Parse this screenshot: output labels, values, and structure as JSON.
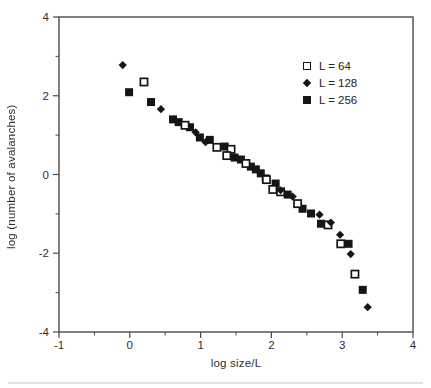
{
  "figure": {
    "background": "#ffffff",
    "frame_color": "#4a4a4a",
    "marker_color": "#151515",
    "text_color": "#2e2e2e"
  },
  "chart_data": {
    "type": "scatter",
    "title": "",
    "xlabel": "log size/L",
    "ylabel": "log (number of avalanches)",
    "xlim": [
      -1,
      4
    ],
    "ylim": [
      -4,
      4
    ],
    "x_major_ticks": [
      -1,
      0,
      1,
      2,
      3,
      4
    ],
    "x_minor_ticks": [
      -0.5,
      0.5,
      1.5,
      2.5,
      3.5
    ],
    "y_major_ticks": [
      -4,
      -2,
      0,
      2,
      4
    ],
    "y_minor_ticks": [
      -3,
      -1,
      1,
      3
    ],
    "grid": false,
    "legend_position": "upper-right-inside",
    "series": [
      {
        "name": "L = 64",
        "marker": "open-square",
        "points": [
          [
            0.2,
            2.35
          ],
          [
            0.78,
            1.25
          ],
          [
            1.23,
            0.69
          ],
          [
            1.43,
            0.64
          ],
          [
            1.37,
            0.48
          ],
          [
            1.64,
            0.28
          ],
          [
            1.93,
            -0.13
          ],
          [
            2.02,
            -0.38
          ],
          [
            2.13,
            -0.44
          ],
          [
            2.37,
            -0.74
          ],
          [
            2.8,
            -1.28
          ],
          [
            2.98,
            -1.76
          ],
          [
            3.18,
            -2.53
          ]
        ]
      },
      {
        "name": "L = 128",
        "marker": "filled-diamond",
        "points": [
          [
            -0.1,
            2.78
          ],
          [
            0.44,
            1.66
          ],
          [
            0.93,
            1.07
          ],
          [
            1.07,
            0.82
          ],
          [
            2.13,
            -0.4
          ],
          [
            2.3,
            -0.56
          ],
          [
            2.68,
            -1.02
          ],
          [
            2.84,
            -1.22
          ],
          [
            2.97,
            -1.53
          ],
          [
            3.12,
            -2.02
          ],
          [
            3.36,
            -3.37
          ]
        ]
      },
      {
        "name": "L = 256",
        "marker": "filled-square",
        "points": [
          [
            -0.01,
            2.09
          ],
          [
            0.3,
            1.84
          ],
          [
            0.61,
            1.4
          ],
          [
            0.69,
            1.33
          ],
          [
            0.85,
            1.2
          ],
          [
            0.99,
            0.94
          ],
          [
            1.13,
            0.88
          ],
          [
            1.34,
            0.71
          ],
          [
            1.48,
            0.43
          ],
          [
            1.57,
            0.38
          ],
          [
            1.71,
            0.2
          ],
          [
            1.78,
            0.13
          ],
          [
            1.85,
            0.03
          ],
          [
            1.92,
            -0.1
          ],
          [
            2.06,
            -0.23
          ],
          [
            2.23,
            -0.51
          ],
          [
            2.44,
            -0.87
          ],
          [
            2.56,
            -0.99
          ],
          [
            2.7,
            -1.25
          ],
          [
            3.09,
            -1.76
          ],
          [
            3.29,
            -2.93
          ]
        ]
      }
    ]
  }
}
